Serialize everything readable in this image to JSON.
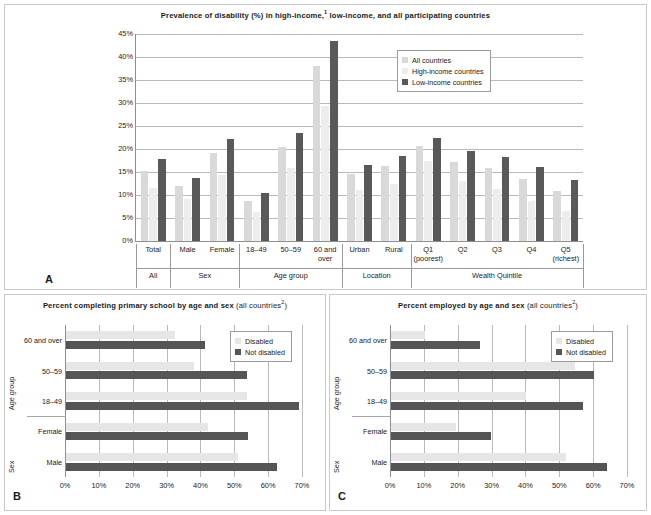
{
  "figure": {
    "panels": [
      {
        "letter": "A"
      },
      {
        "letter": "B"
      },
      {
        "letter": "C"
      }
    ]
  },
  "panelA": {
    "title_main": "Prevalence of disability (%) in high-income,",
    "title_sup": "1",
    "title_rest": " low-income, and all participating countries",
    "letter": "A",
    "legend": [
      {
        "label": "All countries",
        "color": "#d9d9d9"
      },
      {
        "label": "High-income countries",
        "color": "#ededed"
      },
      {
        "label": "Low-income countries",
        "color": "#595959"
      }
    ],
    "y_ticks": [
      "0%",
      "5%",
      "10%",
      "15%",
      "20%",
      "25%",
      "30%",
      "35%",
      "40%",
      "45%"
    ],
    "group_labels": [
      "All",
      "Sex",
      "Age group",
      "Location",
      "Wealth Quintile"
    ]
  },
  "panelB": {
    "title_main": "Percent completing primary school by age and sex",
    "title_sub": " (all countries",
    "title_sup": "2",
    "title_sub_end": ")",
    "letter": "B",
    "legend": [
      {
        "label": "Disabled",
        "color": "#e6e6e6"
      },
      {
        "label": "Not disabled",
        "color": "#555555"
      }
    ],
    "x_ticks": [
      "0%",
      "10%",
      "20%",
      "30%",
      "40%",
      "50%",
      "60%",
      "70%"
    ],
    "axis_titles": [
      "Age group",
      "Sex"
    ]
  },
  "panelC": {
    "title_main": "Percent employed by age and sex",
    "title_sub": " (all countries",
    "title_sup": "2",
    "title_sub_end": ")",
    "letter": "C",
    "legend": [
      {
        "label": "Disabled",
        "color": "#e6e6e6"
      },
      {
        "label": "Not disabled",
        "color": "#555555"
      }
    ],
    "x_ticks": [
      "0%",
      "10%",
      "20%",
      "30%",
      "40%",
      "50%",
      "60%",
      "70%"
    ],
    "axis_titles": [
      "Age group",
      "Sex"
    ]
  },
  "chart_data": [
    {
      "type": "bar",
      "id": "A",
      "title": "Prevalence of disability (%) in high-income,1 low-income, and all participating countries",
      "xlabel": "",
      "ylabel": "",
      "ylim": [
        0,
        45
      ],
      "ytick_step": 5,
      "grid": true,
      "legend_position": "top-right",
      "categories": [
        "Total",
        "Male",
        "Female",
        "18–49",
        "50–59",
        "60 and over",
        "Urban",
        "Rural",
        "Q1 (poorest)",
        "Q2",
        "Q3",
        "Q4",
        "Q5 (richest)"
      ],
      "category_labels": [
        "Total",
        "Male",
        "Female",
        "18–49",
        "50–59",
        "60 and over",
        "Urban",
        "Rural",
        "Q1",
        "Q2",
        "Q3",
        "Q4",
        "Q5"
      ],
      "category_sublabels": [
        "",
        "",
        "",
        "",
        "",
        "",
        "",
        "",
        "(poorest)",
        "",
        "",
        "",
        "(richest)"
      ],
      "groups": [
        {
          "name": "All",
          "span": 1
        },
        {
          "name": "Sex",
          "span": 2
        },
        {
          "name": "Age group",
          "span": 3
        },
        {
          "name": "Location",
          "span": 2
        },
        {
          "name": "Wealth Quintile",
          "span": 5
        }
      ],
      "series": [
        {
          "name": "All countries",
          "color": "#d9d9d9",
          "values": [
            15.3,
            12.0,
            19.2,
            8.8,
            20.5,
            38.0,
            14.5,
            16.3,
            20.6,
            17.2,
            15.8,
            13.5,
            10.8
          ]
        },
        {
          "name": "High-income countries",
          "color": "#ededed",
          "values": [
            11.6,
            9.1,
            14.3,
            6.4,
            15.8,
            29.3,
            11.1,
            12.3,
            17.4,
            13.0,
            11.4,
            8.7,
            6.5
          ]
        },
        {
          "name": "Low-income countries",
          "color": "#595959",
          "values": [
            17.9,
            13.8,
            22.1,
            10.4,
            23.4,
            43.4,
            16.5,
            18.5,
            22.4,
            19.6,
            18.3,
            16.0,
            13.2
          ]
        }
      ]
    },
    {
      "type": "bar",
      "id": "B",
      "orientation": "horizontal",
      "title": "Percent completing primary school by age and sex (all countries2)",
      "xlabel": "",
      "ylabel": "",
      "xlim": [
        0,
        70
      ],
      "xtick_step": 10,
      "grid": true,
      "legend_position": "top-right",
      "categories": [
        "Male",
        "Female",
        "18–49",
        "50–59",
        "60 and over"
      ],
      "axis_groups": [
        {
          "name": "Sex",
          "categories": [
            "Male",
            "Female"
          ]
        },
        {
          "name": "Age group",
          "categories": [
            "18–49",
            "50–59",
            "60 and over"
          ]
        }
      ],
      "series": [
        {
          "name": "Disabled",
          "color": "#e6e6e6",
          "values": [
            50.8,
            42.0,
            53.5,
            37.8,
            32.3
          ]
        },
        {
          "name": "Not disabled",
          "color": "#555555",
          "values": [
            62.3,
            53.7,
            68.7,
            53.4,
            41.2
          ]
        }
      ]
    },
    {
      "type": "bar",
      "id": "C",
      "orientation": "horizontal",
      "title": "Percent employed by age and sex (all countries2)",
      "xlabel": "",
      "ylabel": "",
      "xlim": [
        0,
        70
      ],
      "xtick_step": 10,
      "grid": true,
      "legend_position": "top-right",
      "categories": [
        "Male",
        "Female",
        "18–49",
        "50–59",
        "60 and over"
      ],
      "axis_groups": [
        {
          "name": "Sex",
          "categories": [
            "Male",
            "Female"
          ]
        },
        {
          "name": "Age group",
          "categories": [
            "18–49",
            "50–59",
            "60 and over"
          ]
        }
      ],
      "series": [
        {
          "name": "Disabled",
          "color": "#e6e6e6",
          "values": [
            51.8,
            19.2,
            40.0,
            54.2,
            10.0
          ]
        },
        {
          "name": "Not disabled",
          "color": "#555555",
          "values": [
            63.8,
            29.4,
            56.6,
            60.0,
            26.2
          ]
        }
      ]
    }
  ]
}
